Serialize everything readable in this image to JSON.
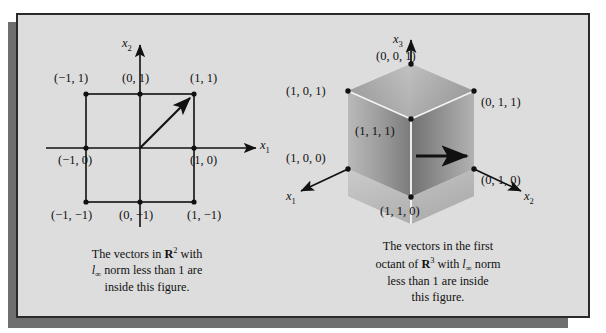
{
  "figure": {
    "background_color": "#dddddd",
    "frame_color": "#2a2a2a",
    "shadow_color": "#6f6f6f",
    "page_color": "#ffffff"
  },
  "left_panel": {
    "title_note": "2D unit square for l-infinity norm",
    "axes": {
      "vertical_label": "x",
      "vertical_sub": "2",
      "horizontal_label": "x",
      "horizontal_sub": "1"
    },
    "vertices": [
      {
        "name": "top-left",
        "label": "(−1, 1)"
      },
      {
        "name": "top-mid",
        "label": "(0, 1)"
      },
      {
        "name": "top-right",
        "label": "(1, 1)"
      },
      {
        "name": "mid-left",
        "label": "(−1, 0)"
      },
      {
        "name": "mid-right",
        "label": "(1, 0)"
      },
      {
        "name": "bottom-left",
        "label": "(−1, −1)"
      },
      {
        "name": "bottom-mid",
        "label": "(0, −1)"
      },
      {
        "name": "bottom-right",
        "label": "(1, −1)"
      }
    ],
    "caption_lines": [
      "The vectors in ℝ² with",
      "l∞ norm less than 1 are",
      "inside this figure."
    ],
    "caption": {
      "line1_pre": "The vectors in ",
      "line1_blackboard": "R",
      "line1_sup": "2",
      "line1_post": " with",
      "line2_ell": "l",
      "line2_ell_sub": "∞",
      "line2_post": " norm less than 1 are",
      "line3": "inside this figure."
    }
  },
  "right_panel": {
    "title_note": "first octant unit cube for l-infinity norm",
    "axes": {
      "vertical_label": "x",
      "vertical_sub": "3",
      "left_label": "x",
      "left_sub": "1",
      "right_label": "x",
      "right_sub": "2"
    },
    "vertices": [
      {
        "name": "top-apex",
        "label": "(0, 0, 1)"
      },
      {
        "name": "top-left",
        "label": "(1, 0, 1)"
      },
      {
        "name": "top-right",
        "label": "(0, 1, 1)"
      },
      {
        "name": "center",
        "label": "(1, 1, 1)"
      },
      {
        "name": "left-base",
        "label": "(1, 0, 0)"
      },
      {
        "name": "right-base",
        "label": "(0, 1, 0)"
      },
      {
        "name": "bottom",
        "label": "(1, 1, 0)"
      }
    ],
    "caption": {
      "line1": "The vectors in the first",
      "line2_pre": "octant of ",
      "line2_blackboard": "R",
      "line2_sup": "3",
      "line2_mid": " with ",
      "line2_ell": "l",
      "line2_ell_sub": "∞",
      "line2_post": " norm",
      "line3": "less than 1 are inside",
      "line4": "this figure."
    }
  }
}
